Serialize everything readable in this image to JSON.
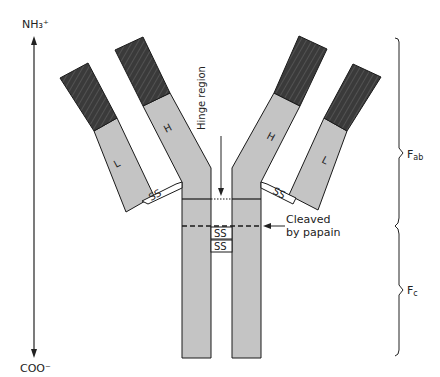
{
  "diagram": {
    "terminus": {
      "top": "NH₃⁺",
      "bottom": "COO⁻"
    },
    "chains": {
      "heavy_label": "H",
      "light_label": "L"
    },
    "bonds": {
      "disulfide": "SS"
    },
    "annotations": {
      "hinge": "Hinge region",
      "cleave_line1": "Cleaved",
      "cleave_line2": "by papain"
    },
    "fragments": {
      "fab": "F",
      "fab_sub": "ab",
      "fc": "F",
      "fc_sub": "c"
    },
    "colors": {
      "constant_region": "#c4c4c4",
      "variable_region": "#3a3a3a",
      "outline": "#1a1a1a"
    }
  }
}
